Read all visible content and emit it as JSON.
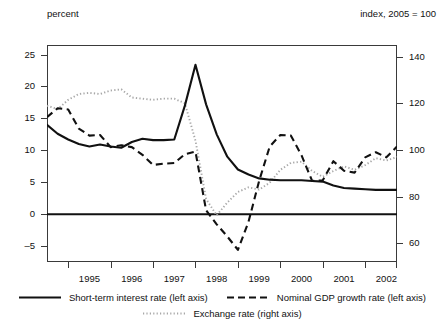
{
  "labels": {
    "left_axis_caption": "percent",
    "right_axis_caption": "index, 2005 = 100"
  },
  "legend": {
    "items": [
      {
        "label": "Short-term interest  rate (left axis)",
        "style": "solid",
        "icon": "solid-line-icon"
      },
      {
        "label": "Nominal GDP growth rate  (left axis)",
        "style": "dashed",
        "icon": "dashed-line-icon"
      },
      {
        "label": "Exchange rate (right axis)",
        "style": "dotted",
        "icon": "dotted-line-icon"
      }
    ]
  },
  "chart_data": {
    "type": "line",
    "title": "",
    "xlabel": "",
    "ylabel": "percent",
    "y2label": "index, 2005 = 100",
    "grid": false,
    "legend_position": "bottom",
    "xlim": [
      1994.5,
      2002.75
    ],
    "ylim": [
      -7.5,
      26.5
    ],
    "y2lim": [
      52.0,
      145.0
    ],
    "yticks": [
      25,
      20,
      15,
      10,
      5,
      0,
      -5
    ],
    "y2ticks": [
      140,
      120,
      100,
      80,
      60
    ],
    "xticks": [
      1995,
      1996,
      1997,
      1998,
      1999,
      2000,
      2001,
      2002
    ],
    "zero_line": 0,
    "series": [
      {
        "name": "Short-term interest  rate (left axis)",
        "axis": "left",
        "style": "solid",
        "x": [
          1994.5,
          1994.75,
          1995.0,
          1995.25,
          1995.5,
          1995.75,
          1996.0,
          1996.25,
          1996.5,
          1996.75,
          1997.0,
          1997.25,
          1997.5,
          1997.75,
          1998.0,
          1998.25,
          1998.5,
          1998.75,
          1999.0,
          1999.25,
          1999.5,
          1999.75,
          2000.0,
          2000.25,
          2000.5,
          2000.75,
          2001.0,
          2001.25,
          2001.5,
          2001.75,
          2002.0,
          2002.25,
          2002.5,
          2002.75
        ],
        "y": [
          14.0,
          12.6,
          11.7,
          11.0,
          10.6,
          10.9,
          10.6,
          10.4,
          11.3,
          11.8,
          11.6,
          11.6,
          11.7,
          17.0,
          23.4,
          17.2,
          12.5,
          9.0,
          7.0,
          6.2,
          5.6,
          5.4,
          5.3,
          5.3,
          5.3,
          5.2,
          5.1,
          4.5,
          4.1,
          4.0,
          3.9,
          3.8,
          3.8,
          3.8
        ]
      },
      {
        "name": "Nominal GDP growth rate  (left axis)",
        "axis": "left",
        "style": "dashed",
        "x": [
          1994.5,
          1994.75,
          1995.0,
          1995.25,
          1995.5,
          1995.75,
          1996.0,
          1996.25,
          1996.5,
          1996.75,
          1997.0,
          1997.25,
          1997.5,
          1997.75,
          1998.0,
          1998.25,
          1998.5,
          1998.75,
          1999.0,
          1999.25,
          1999.5,
          1999.75,
          2000.0,
          2000.25,
          2000.5,
          2000.75,
          2001.0,
          2001.25,
          2001.5,
          2001.75,
          2002.0,
          2002.25,
          2002.5,
          2002.75
        ],
        "y": [
          15.2,
          16.6,
          16.4,
          13.4,
          12.3,
          12.4,
          10.5,
          10.8,
          10.5,
          9.3,
          7.7,
          7.9,
          8.0,
          9.4,
          9.8,
          0.6,
          -1.6,
          -3.5,
          -5.6,
          -1.2,
          5.2,
          10.6,
          12.4,
          12.3,
          9.2,
          5.2,
          5.3,
          8.3,
          6.8,
          6.5,
          8.9,
          9.7,
          8.9,
          10.6
        ]
      },
      {
        "name": "Exchange rate (right axis)",
        "axis": "right",
        "style": "dotted",
        "x": [
          1994.5,
          1994.75,
          1995.0,
          1995.25,
          1995.5,
          1995.75,
          1996.0,
          1996.25,
          1996.5,
          1996.75,
          1997.0,
          1997.25,
          1997.5,
          1997.75,
          1998.0,
          1998.25,
          1998.5,
          1998.75,
          1999.0,
          1999.25,
          1999.5,
          1999.75,
          2000.0,
          2000.25,
          2000.5,
          2000.75,
          2001.0,
          2001.25,
          2001.5,
          2001.75,
          2002.0,
          2002.25,
          2002.5,
          2002.75
        ],
        "y": [
          119.0,
          117.5,
          121.5,
          124.0,
          124.5,
          124.0,
          125.5,
          126.0,
          122.5,
          122.0,
          121.5,
          122.0,
          122.0,
          120.0,
          104.0,
          79.0,
          72.0,
          77.5,
          82.0,
          84.0,
          83.0,
          86.0,
          91.5,
          94.5,
          95.0,
          91.0,
          88.5,
          91.0,
          93.0,
          91.5,
          93.5,
          96.5,
          95.5,
          97.0
        ]
      }
    ]
  },
  "colors": {
    "solid_line": "#111111",
    "dashed_line": "#111111",
    "dotted_line": "#a8a8a8",
    "frame": "#3a3a3a",
    "zero_line": "#111111"
  }
}
